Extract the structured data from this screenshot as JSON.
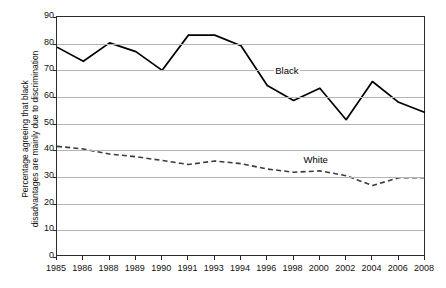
{
  "chart_data": {
    "type": "line",
    "title": "",
    "xlabel": "",
    "ylabel": "Percentage agreeing that black disadvantages are mainly due to discrimination",
    "ylabel_lines": [
      "Percentage agreeing that black",
      "disadvantages are mainly due to discrimination"
    ],
    "categories": [
      "1985",
      "1986",
      "1988",
      "1989",
      "1990",
      "1991",
      "1993",
      "1994",
      "1996",
      "1998",
      "2000",
      "2002",
      "2004",
      "2006",
      "2008"
    ],
    "xticklabels": [
      "1985",
      "1986",
      "1988",
      "1989",
      "1990",
      "1991",
      "1993",
      "1994",
      "1996",
      "1998",
      "2000",
      "2002",
      "2004",
      "2006",
      "2008"
    ],
    "yticklabels": [
      "0",
      "10",
      "20",
      "30",
      "40",
      "50",
      "60",
      "70",
      "80",
      "90"
    ],
    "ylim": [
      0,
      90
    ],
    "ytick_step": 10,
    "grid": true,
    "legend_position": "inline-annotation",
    "series": [
      {
        "name": "Black",
        "style": "solid",
        "color": "#000000",
        "label_x_category": "1996",
        "values": [
          78.7,
          73.4,
          80.3,
          77.0,
          70.0,
          83.2,
          83.2,
          79.2,
          64.3,
          58.7,
          63.3,
          51.5,
          65.8,
          58.0,
          54.2
        ]
      },
      {
        "name": "White",
        "style": "dashed",
        "color": "#3c3c3c",
        "label_x_category": "1998",
        "values": [
          41.5,
          40.5,
          38.6,
          37.6,
          36.2,
          34.7,
          36.0,
          35.0,
          33.0,
          31.8,
          32.3,
          30.5,
          26.8,
          29.7,
          29.7
        ]
      }
    ],
    "annotations": [
      {
        "text": "Black",
        "series": "Black"
      },
      {
        "text": "White",
        "series": "White"
      }
    ]
  }
}
